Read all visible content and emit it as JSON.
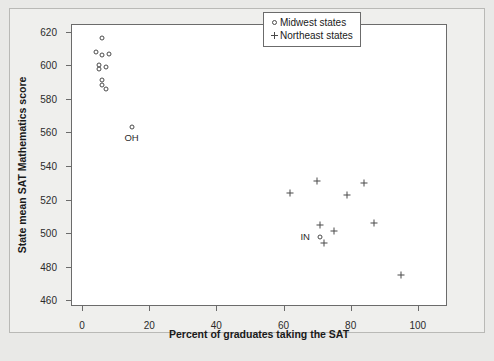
{
  "chart_data": {
    "type": "scatter",
    "title": "",
    "xlabel": "Percent of graduates taking the SAT",
    "ylabel": "State mean SAT Mathematics score",
    "xlim": [
      -3,
      109
    ],
    "ylim": [
      456,
      624
    ],
    "xticks": [
      0,
      20,
      40,
      60,
      80,
      100
    ],
    "yticks": [
      460,
      480,
      500,
      520,
      540,
      560,
      580,
      600,
      620
    ],
    "grid": false,
    "legend_position": "top-right",
    "series": [
      {
        "name": "Midwest states",
        "marker": "circle",
        "points": [
          {
            "x": 6,
            "y": 616,
            "label": ""
          },
          {
            "x": 4,
            "y": 608,
            "label": ""
          },
          {
            "x": 6,
            "y": 606,
            "label": ""
          },
          {
            "x": 8,
            "y": 607,
            "label": ""
          },
          {
            "x": 5,
            "y": 600,
            "label": ""
          },
          {
            "x": 5,
            "y": 598,
            "label": ""
          },
          {
            "x": 7,
            "y": 599,
            "label": ""
          },
          {
            "x": 6,
            "y": 591,
            "label": ""
          },
          {
            "x": 6,
            "y": 588,
            "label": ""
          },
          {
            "x": 7,
            "y": 586,
            "label": ""
          },
          {
            "x": 15,
            "y": 563,
            "label": "OH"
          },
          {
            "x": 71,
            "y": 498,
            "label": "IN"
          }
        ]
      },
      {
        "name": "Northeast states",
        "marker": "plus",
        "points": [
          {
            "x": 62,
            "y": 524,
            "label": ""
          },
          {
            "x": 70,
            "y": 531,
            "label": ""
          },
          {
            "x": 79,
            "y": 523,
            "label": ""
          },
          {
            "x": 84,
            "y": 530,
            "label": ""
          },
          {
            "x": 71,
            "y": 505,
            "label": ""
          },
          {
            "x": 75,
            "y": 501,
            "label": ""
          },
          {
            "x": 72,
            "y": 494,
            "label": ""
          },
          {
            "x": 87,
            "y": 506,
            "label": ""
          },
          {
            "x": 95,
            "y": 475,
            "label": ""
          }
        ]
      }
    ],
    "legend": [
      {
        "marker": "circle",
        "label": "Midwest states"
      },
      {
        "marker": "plus",
        "label": "Northeast states"
      }
    ]
  }
}
